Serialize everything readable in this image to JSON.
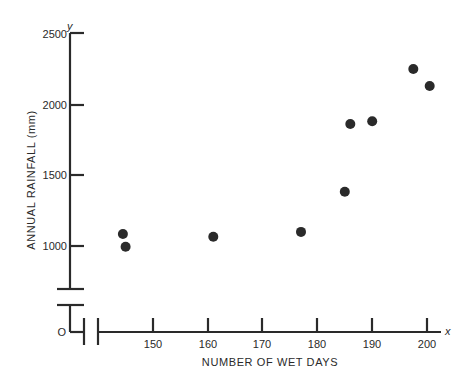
{
  "chart_data": {
    "type": "scatter",
    "title": "",
    "xlabel": "NUMBER OF WET DAYS",
    "ylabel": "ANNUAL RAINFALL (mm)",
    "x_axis_letter": "x",
    "y_axis_letter": "y",
    "origin_label": "O",
    "xlim": [
      140,
      202
    ],
    "ylim": [
      700,
      2500
    ],
    "x_ticks": [
      150,
      160,
      170,
      180,
      190,
      200
    ],
    "y_ticks": [
      1000,
      1500,
      2000,
      2500
    ],
    "axis_breaks": {
      "x": true,
      "y": true
    },
    "grid": false,
    "legend": null,
    "series": [
      {
        "name": "Annual rainfall vs wet days",
        "color": "#2a2a2a",
        "points": [
          {
            "x": 144.5,
            "y": 1085
          },
          {
            "x": 145,
            "y": 995
          },
          {
            "x": 161,
            "y": 1065
          },
          {
            "x": 177,
            "y": 1100
          },
          {
            "x": 185,
            "y": 1385
          },
          {
            "x": 186,
            "y": 1865
          },
          {
            "x": 190,
            "y": 1885
          },
          {
            "x": 197.5,
            "y": 2255
          },
          {
            "x": 200.5,
            "y": 2135
          }
        ]
      }
    ]
  },
  "labels": {
    "xlabel": "NUMBER OF WET DAYS",
    "ylabel": "ANNUAL RAINFALL (mm)",
    "x_letter": "x",
    "y_letter": "y",
    "origin": "O",
    "x_ticks": [
      "150",
      "160",
      "170",
      "180",
      "190",
      "200"
    ],
    "y_ticks": [
      "2500",
      "2000",
      "1500",
      "1000"
    ]
  }
}
